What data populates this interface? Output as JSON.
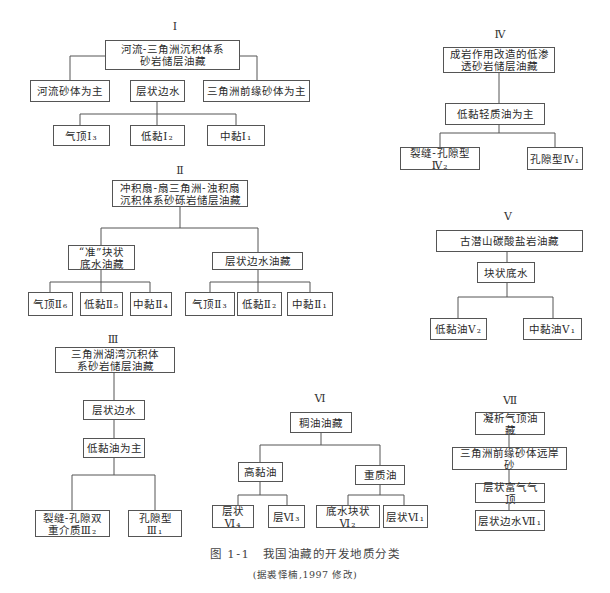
{
  "groups": {
    "g1": {
      "label": "Ⅰ",
      "root": "河流-三角洲沉积体系\n砂岩储层油藏",
      "children": [
        "河流砂体为主",
        "层状边水",
        "三角洲前缘砂体为主"
      ],
      "leaves": [
        "气顶Ⅰ₃",
        "低黏Ⅰ₂",
        "中黏Ⅰ₁"
      ]
    },
    "g2": {
      "label": "Ⅱ",
      "root": "冲积扇-扇三角洲-浊积扇\n沉积体系砂砾岩储层油藏",
      "children": [
        "“准”块状\n底水油藏",
        "层状边水油藏"
      ],
      "leaves": [
        "气顶Ⅱ₆",
        "低黏Ⅱ₅",
        "中黏Ⅱ₄",
        "气顶Ⅱ₃",
        "低黏Ⅱ₂",
        "中黏Ⅱ₁"
      ]
    },
    "g3": {
      "label": "Ⅲ",
      "root": "三角洲湖湾沉积体\n系砂岩储层油藏",
      "children": [
        "层状边水",
        "低黏油为主"
      ],
      "leaves": [
        "裂缝-孔隙双\n重介质Ⅲ₂",
        "孔隙型\nⅢ₁"
      ]
    },
    "g4": {
      "label": "Ⅳ",
      "root": "成岩作用改造的低渗\n透砂岩储层油藏",
      "children": [
        "低黏轻质油为主"
      ],
      "leaves": [
        "裂缝-孔隙型Ⅳ₂",
        "孔隙型Ⅳ₁"
      ]
    },
    "g5": {
      "label": "Ⅴ",
      "root": "古潜山碳酸盐岩油藏",
      "children": [
        "块状底水"
      ],
      "leaves": [
        "低黏油Ⅴ₂",
        "中黏油Ⅴ₁"
      ]
    },
    "g6": {
      "label": "Ⅵ",
      "root": "稠油油藏",
      "children": [
        "高黏油",
        "重质油"
      ],
      "leaves": [
        "层状Ⅵ₄",
        "层Ⅵ₃",
        "底水块状Ⅵ₂",
        "层状Ⅵ₁"
      ]
    },
    "g7": {
      "label": "Ⅶ",
      "root": "凝析气顶油藏",
      "children": [
        "三角洲前缘砂体远岸砂",
        "层状富气气顶"
      ],
      "leaves": [
        "层状边水Ⅶ₁"
      ]
    }
  },
  "caption": {
    "title": "图 1-1　我国油藏的开发地质分类",
    "source": "(据裘怿楠,1997 修改)"
  }
}
